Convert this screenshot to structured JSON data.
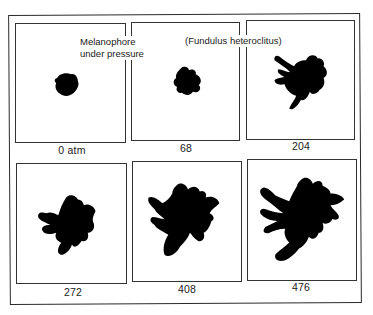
{
  "figure": {
    "title_left_line1": "Melanophore",
    "title_left_line2": "under pressure",
    "title_right": "(Fundulus heteroclitus)",
    "panels": [
      {
        "label": "0 atm",
        "pressure": 0
      },
      {
        "label": "68",
        "pressure": 68
      },
      {
        "label": "204",
        "pressure": 204
      },
      {
        "label": "272",
        "pressure": 272
      },
      {
        "label": "408",
        "pressure": 408
      },
      {
        "label": "476",
        "pressure": 476
      }
    ],
    "colors": {
      "ink": "#000000",
      "frame": "#2a2a2a",
      "background": "#ffffff"
    }
  }
}
